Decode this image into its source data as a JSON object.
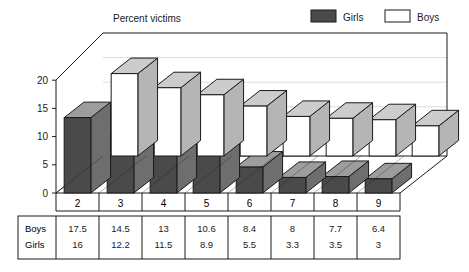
{
  "chart_data": {
    "type": "bar",
    "title": "Percent victims",
    "xlabel": "",
    "ylabel": "",
    "categories": [
      "2",
      "3",
      "4",
      "5",
      "6",
      "7",
      "8",
      "9"
    ],
    "series": [
      {
        "name": "Boys",
        "values": [
          17.5,
          14.5,
          13,
          10.6,
          8.4,
          8,
          7.7,
          6.4
        ]
      },
      {
        "name": "Girls",
        "values": [
          16,
          12.2,
          11.5,
          8.9,
          5.5,
          3.3,
          3.5,
          3
        ]
      }
    ],
    "yticks": [
      0,
      5,
      10,
      15,
      20
    ],
    "ylim": [
      0,
      24
    ],
    "grid": true,
    "legend_position": "top-right",
    "projection": "3d"
  },
  "legend": {
    "items": [
      {
        "label": "Girls",
        "color": "#4a4a4a"
      },
      {
        "label": "Boys",
        "color": "#ffffff"
      }
    ]
  },
  "data_table": {
    "row_headers": [
      "Boys",
      "Girls"
    ],
    "columns": [
      "2",
      "3",
      "4",
      "5",
      "6",
      "7",
      "8",
      "9"
    ],
    "rows": [
      [
        "17.5",
        "14.5",
        "13",
        "10.6",
        "8.4",
        "8",
        "7.7",
        "6.4"
      ],
      [
        "16",
        "12.2",
        "11.5",
        "8.9",
        "5.5",
        "3.3",
        "3.5",
        "3"
      ]
    ]
  },
  "axis": {
    "tick_labels": [
      "20",
      "15",
      "10",
      "5",
      "0"
    ],
    "category_labels": [
      "2",
      "3",
      "4",
      "5",
      "6",
      "7",
      "8",
      "9"
    ]
  },
  "colors": {
    "girls_front": "#4a4a4a",
    "girls_top": "#9d9d9d",
    "girls_side": "#6e6e6e",
    "boys_front": "#ffffff",
    "boys_top": "#cccccc",
    "boys_side": "#b5b5b5",
    "outline": "#1a1a1a",
    "grid": "#d8d8d8",
    "wall": "#ffffff"
  }
}
